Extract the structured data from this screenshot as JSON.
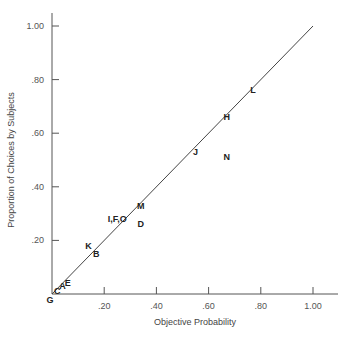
{
  "chart_data": {
    "type": "scatter",
    "title": "",
    "xlabel": "Objective Probability",
    "ylabel": "Proportion of Choices by Subjects",
    "xlim": [
      0,
      1.1
    ],
    "ylim": [
      0,
      1.05
    ],
    "grid": false,
    "x_ticks": [
      ".20",
      ".40",
      ".60",
      ".80",
      "1.00"
    ],
    "y_ticks": [
      ".20",
      ".40",
      ".60",
      ".80",
      "1.00"
    ],
    "reference_line": {
      "from": [
        0,
        0
      ],
      "to": [
        1.0,
        1.0
      ],
      "label": "identity line"
    },
    "points": [
      {
        "label": "G",
        "x": 0.0,
        "y": 0.0
      },
      {
        "label": "C",
        "x": 0.02,
        "y": 0.01
      },
      {
        "label": "A",
        "x": 0.04,
        "y": 0.03
      },
      {
        "label": "E",
        "x": 0.06,
        "y": 0.04
      },
      {
        "label": "K",
        "x": 0.14,
        "y": 0.18
      },
      {
        "label": "B",
        "x": 0.17,
        "y": 0.15
      },
      {
        "label": "I,F,O",
        "x": 0.25,
        "y": 0.28
      },
      {
        "label": "M",
        "x": 0.34,
        "y": 0.33
      },
      {
        "label": "D",
        "x": 0.34,
        "y": 0.26
      },
      {
        "label": "J",
        "x": 0.55,
        "y": 0.53
      },
      {
        "label": "N",
        "x": 0.67,
        "y": 0.51
      },
      {
        "label": "H",
        "x": 0.67,
        "y": 0.66
      },
      {
        "label": "L",
        "x": 0.77,
        "y": 0.76
      }
    ]
  }
}
